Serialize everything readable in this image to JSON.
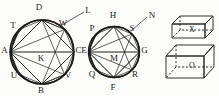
{
  "figure": {
    "ink_color": "#1d1d1d",
    "background_color": "#fdfdfb",
    "circle_left": {
      "name": "left-circle",
      "center_label": "K",
      "labels": {
        "left": "A",
        "right": "C",
        "top": "D",
        "bottom": "B",
        "upper_left": "T",
        "upper_right": "W",
        "lower_left": "U",
        "lower_right": "V",
        "center": "K"
      },
      "vertices": [
        "A",
        "T",
        "D",
        "W",
        "C",
        "V",
        "B",
        "U"
      ],
      "pointer_label": "L"
    },
    "circle_right": {
      "name": "right-circle",
      "center_label": "M",
      "labels": {
        "left": "E",
        "right": "G",
        "top": "H",
        "bottom": "F",
        "upper_left": "P",
        "upper_right": "S",
        "lower_left": "Q",
        "lower_right": "R",
        "center": "M"
      },
      "vertices": [
        "E",
        "P",
        "H",
        "S",
        "G",
        "R",
        "F",
        "Q"
      ],
      "pointer_label": "N"
    },
    "solids": [
      {
        "name": "box-top",
        "label": "X"
      },
      {
        "name": "box-bottom",
        "label": "O"
      }
    ]
  }
}
